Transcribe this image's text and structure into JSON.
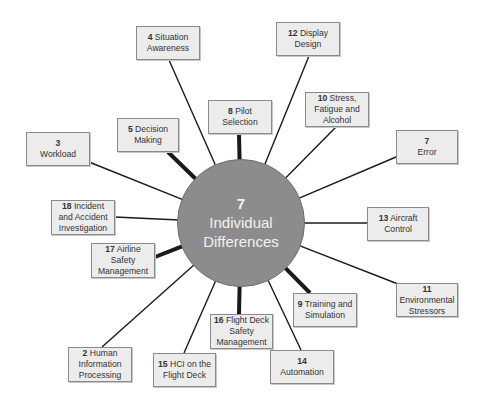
{
  "hub": {
    "number": "7",
    "label_line1": "Individual",
    "label_line2": "Differences",
    "fill": "#8c8c8c",
    "cx": 241,
    "cy": 223,
    "r": 64
  },
  "nodes": [
    {
      "id": "n4",
      "number": "4",
      "text": "Situation Awareness",
      "break": false,
      "x": 136,
      "y": 26,
      "w": 64,
      "h": 34,
      "thick": false,
      "ax": 169,
      "ay": 60
    },
    {
      "id": "n12",
      "number": "12",
      "text": "Display Design",
      "break": false,
      "x": 276,
      "y": 22,
      "w": 64,
      "h": 34,
      "thick": false,
      "ax": 309,
      "ay": 56
    },
    {
      "id": "n8",
      "number": "8",
      "text": "Pilot Selection",
      "break": false,
      "x": 208,
      "y": 100,
      "w": 64,
      "h": 34,
      "thick": true,
      "ax": 239,
      "ay": 134
    },
    {
      "id": "n10",
      "number": "10",
      "text": "Stress, Fatigue and Alcohol",
      "break": false,
      "x": 305,
      "y": 92,
      "w": 64,
      "h": 35,
      "thick": false,
      "ax": 336,
      "ay": 127
    },
    {
      "id": "n7",
      "number": "7",
      "text": "Error",
      "break": true,
      "x": 396,
      "y": 130,
      "w": 62,
      "h": 34,
      "thick": false,
      "ax": 396,
      "ay": 157
    },
    {
      "id": "n3",
      "number": "3",
      "text": "Workload",
      "break": true,
      "x": 26,
      "y": 132,
      "w": 64,
      "h": 34,
      "thick": false,
      "ax": 89,
      "ay": 162
    },
    {
      "id": "n5",
      "number": "5",
      "text": "Decision Making",
      "break": false,
      "x": 117,
      "y": 118,
      "w": 62,
      "h": 34,
      "thick": true,
      "ax": 168,
      "ay": 152
    },
    {
      "id": "n13",
      "number": "13",
      "text": "Aircraft Control",
      "break": false,
      "x": 367,
      "y": 207,
      "w": 62,
      "h": 34,
      "thick": false,
      "ax": 367,
      "ay": 223
    },
    {
      "id": "n18",
      "number": "18",
      "text": "Incident and Accident Investigation",
      "break": false,
      "x": 51,
      "y": 200,
      "w": 64,
      "h": 35,
      "thick": false,
      "ax": 115,
      "ay": 217
    },
    {
      "id": "n17",
      "number": "17",
      "text": "Airline Safety Management",
      "break": false,
      "x": 91,
      "y": 243,
      "w": 64,
      "h": 35,
      "thick": true,
      "ax": 155,
      "ay": 257
    },
    {
      "id": "n11",
      "number": "11",
      "text": "Environmental Stressors",
      "break": true,
      "x": 396,
      "y": 283,
      "w": 62,
      "h": 34,
      "thick": false,
      "ax": 398,
      "ay": 284
    },
    {
      "id": "n9",
      "number": "9",
      "text": "Training and Simulation",
      "break": false,
      "x": 293,
      "y": 293,
      "w": 64,
      "h": 34,
      "thick": true,
      "ax": 310,
      "ay": 293
    },
    {
      "id": "n16",
      "number": "16",
      "text": "Flight Deck Safety Management",
      "break": false,
      "x": 210,
      "y": 314,
      "w": 63,
      "h": 35,
      "thick": true,
      "ax": 239,
      "ay": 314
    },
    {
      "id": "n14",
      "number": "14",
      "text": "Automation",
      "break": true,
      "x": 270,
      "y": 350,
      "w": 64,
      "h": 34,
      "thick": false,
      "ax": 301,
      "ay": 350
    },
    {
      "id": "n15",
      "number": "15",
      "text": "HCI on the Flight Deck",
      "break": false,
      "x": 153,
      "y": 353,
      "w": 63,
      "h": 34,
      "thick": false,
      "ax": 184,
      "ay": 353
    },
    {
      "id": "n2",
      "number": "2",
      "text": "Human Information Processing",
      "break": false,
      "x": 68,
      "y": 347,
      "w": 64,
      "h": 35,
      "thick": false,
      "ax": 102,
      "ay": 347
    }
  ],
  "colors": {
    "line": "#1a1a1a",
    "box_fill": "#ececec",
    "box_border": "#8a8a8a"
  }
}
